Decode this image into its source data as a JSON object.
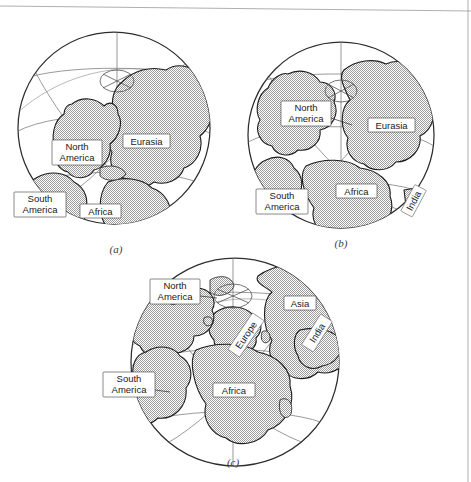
{
  "figure": {
    "background_color": "#ffffff",
    "land_fill_color": "#c9c9c9",
    "land_outline_color": "#1c1c1c",
    "graticule_color": "#6e6e6e",
    "label_box_fill": "#ffffff",
    "label_text_color": "#1a1a1a"
  },
  "panels": [
    {
      "id": "a",
      "caption": "(a)",
      "labels": [
        {
          "text": "North America",
          "lines": [
            "North",
            "America"
          ]
        },
        {
          "text": "Eurasia",
          "lines": [
            "Eurasia"
          ]
        },
        {
          "text": "South America",
          "lines": [
            "South",
            "America"
          ]
        },
        {
          "text": "Africa",
          "lines": [
            "Africa"
          ]
        }
      ]
    },
    {
      "id": "b",
      "caption": "(b)",
      "labels": [
        {
          "text": "North America",
          "lines": [
            "North",
            "America"
          ]
        },
        {
          "text": "Eurasia",
          "lines": [
            "Eurasia"
          ]
        },
        {
          "text": "South America",
          "lines": [
            "South",
            "America"
          ]
        },
        {
          "text": "Africa",
          "lines": [
            "Africa"
          ]
        },
        {
          "text": "India",
          "lines": [
            "India"
          ]
        }
      ]
    },
    {
      "id": "c",
      "caption": "(c)",
      "labels": [
        {
          "text": "North America",
          "lines": [
            "North",
            "America"
          ]
        },
        {
          "text": "Asia",
          "lines": [
            "Asia"
          ]
        },
        {
          "text": "Europe",
          "lines": [
            "Europe"
          ]
        },
        {
          "text": "India",
          "lines": [
            "India"
          ]
        },
        {
          "text": "South America",
          "lines": [
            "South",
            "America"
          ]
        },
        {
          "text": "Africa",
          "lines": [
            "Africa"
          ]
        }
      ]
    }
  ],
  "captions": {
    "a": "(a)",
    "b": "(b)",
    "c": "(c)"
  },
  "label_text": {
    "north": "North",
    "america": "America",
    "eurasia": "Eurasia",
    "south": "South",
    "africa": "Africa",
    "india": "India",
    "asia": "Asia",
    "europe": "Europe"
  }
}
